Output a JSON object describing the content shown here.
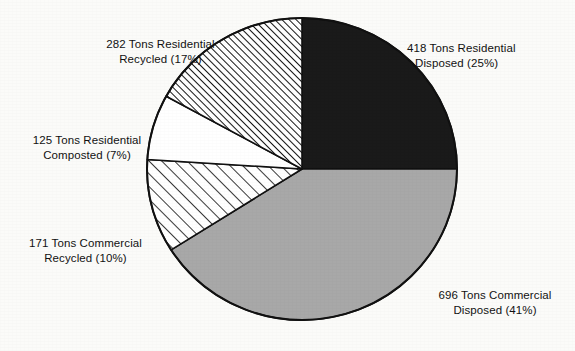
{
  "chart_data": {
    "type": "pie",
    "title": "",
    "subtitle": "",
    "xlabel": "",
    "ylabel": "",
    "legend_position": "none",
    "grid": false,
    "units": "Tons",
    "total_tons": 1692,
    "start_angle_deg": 0,
    "direction": "clockwise",
    "categories": [
      "Residential Disposed",
      "Commercial Disposed",
      "Commercial Recycled",
      "Residential Composted",
      "Residential Recycled"
    ],
    "values": [
      418,
      696,
      171,
      125,
      282
    ],
    "percentages": [
      25,
      41,
      10,
      7,
      17
    ],
    "slices": [
      {
        "name": "residential-disposed",
        "label_line1": "418 Tons Residential",
        "label_line2": "Disposed  (25%)",
        "tons": 418,
        "percent": 17,
        "percent_shown": 25,
        "fill_style": "solid-black",
        "color": "#1a1a1a",
        "start_deg": 0,
        "end_deg": 90
      },
      {
        "name": "commercial-disposed",
        "label_line1": "696 Tons Commercial",
        "label_line2": "Disposed (41%)",
        "tons": 696,
        "percent_shown": 41,
        "fill_style": "solid-gray",
        "color": "#a8a8a8",
        "start_deg": 90,
        "end_deg": 237.6
      },
      {
        "name": "commercial-recycled",
        "label_line1": "171 Tons Commercial",
        "label_line2": "Recycled (10%)",
        "tons": 171,
        "percent_shown": 10,
        "fill_style": "diagonal-hatch-wide",
        "color": "#ffffff",
        "start_deg": 237.6,
        "end_deg": 273.6
      },
      {
        "name": "residential-composted",
        "label_line1": "125 Tons Residential",
        "label_line2": "Composted (7%)",
        "tons": 125,
        "percent_shown": 7,
        "fill_style": "solid-white",
        "color": "#ffffff",
        "start_deg": 273.6,
        "end_deg": 298.8
      },
      {
        "name": "residential-recycled",
        "label_line1": "282 Tons Residential",
        "label_line2": "Recycled (17%)",
        "tons": 282,
        "percent_shown": 17,
        "fill_style": "diagonal-hatch-fine",
        "color": "#ffffff",
        "start_deg": 298.8,
        "end_deg": 360
      }
    ]
  },
  "colors": {
    "background": "#fbfbf9",
    "outline": "#111111",
    "black_slice": "#1a1a1a",
    "gray_slice": "#a8a8a8",
    "white_slice": "#ffffff",
    "text": "#121212"
  },
  "geometry": {
    "center_x": 302,
    "center_y": 169,
    "radius_x": 155,
    "radius_y": 151
  }
}
